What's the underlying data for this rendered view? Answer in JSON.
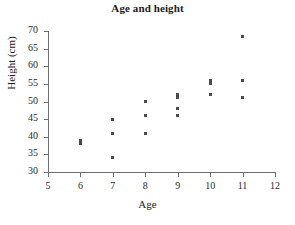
{
  "chart_data": {
    "type": "scatter",
    "title": "Age and height",
    "xlabel": "Age",
    "ylabel": "Height (cm)",
    "xlim": [
      5,
      12
    ],
    "ylim": [
      30,
      70
    ],
    "xticks": [
      5,
      6,
      7,
      8,
      9,
      10,
      11,
      12
    ],
    "yticks": [
      30,
      35,
      40,
      45,
      50,
      55,
      60,
      65,
      70
    ],
    "grid": false,
    "legend": null,
    "marker": "square",
    "marker_color": "#4a4a4a",
    "points": [
      {
        "x": 6,
        "y": 39.0
      },
      {
        "x": 6,
        "y": 38.0
      },
      {
        "x": 7,
        "y": 45.0
      },
      {
        "x": 7,
        "y": 41.0
      },
      {
        "x": 7,
        "y": 34.0
      },
      {
        "x": 8,
        "y": 50.0
      },
      {
        "x": 8,
        "y": 46.0
      },
      {
        "x": 8,
        "y": 41.0
      },
      {
        "x": 9,
        "y": 52.0
      },
      {
        "x": 9,
        "y": 51.0
      },
      {
        "x": 9,
        "y": 48.0
      },
      {
        "x": 9,
        "y": 46.0
      },
      {
        "x": 10,
        "y": 56.0
      },
      {
        "x": 10,
        "y": 55.0
      },
      {
        "x": 10,
        "y": 52.0
      },
      {
        "x": 11,
        "y": 68.5
      },
      {
        "x": 11,
        "y": 56.0
      },
      {
        "x": 11,
        "y": 51.0
      }
    ]
  }
}
